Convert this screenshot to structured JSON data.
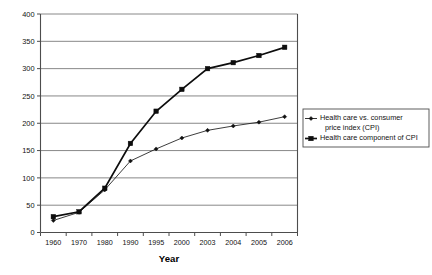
{
  "chart_data": {
    "type": "line",
    "title": "",
    "xlabel": "Year",
    "ylabel": "",
    "categories": [
      "1960",
      "1970",
      "1980",
      "1990",
      "1995",
      "2000",
      "2003",
      "2004",
      "2005",
      "2006"
    ],
    "ylim": [
      0,
      400
    ],
    "ytick_step": 50,
    "ytick_labels": [
      "0",
      "50",
      "100",
      "150",
      "200",
      "250",
      "300",
      "350",
      "400"
    ],
    "grid": true,
    "legend_position": "right",
    "series": [
      {
        "name": "Health care vs. consumer price index (CPI)",
        "marker": "diamond",
        "values": [
          22,
          37,
          78,
          131,
          153,
          173,
          187,
          195,
          202,
          212
        ]
      },
      {
        "name": "Health care component of CPI",
        "marker": "square",
        "values": [
          29,
          38,
          81,
          163,
          222,
          262,
          300,
          311,
          324,
          339
        ]
      }
    ]
  },
  "legend": {
    "entries": [
      {
        "label_line1": "Health care vs. consumer",
        "label_line2": "price index (CPI)"
      },
      {
        "label_line1": "Health care component of CPI",
        "label_line2": ""
      }
    ]
  },
  "colors": {
    "series1": "#111111",
    "series2": "#0d0d0d",
    "grid": "#7a7a7a",
    "axis": "#4d4d4d",
    "background": "#ffffff"
  }
}
